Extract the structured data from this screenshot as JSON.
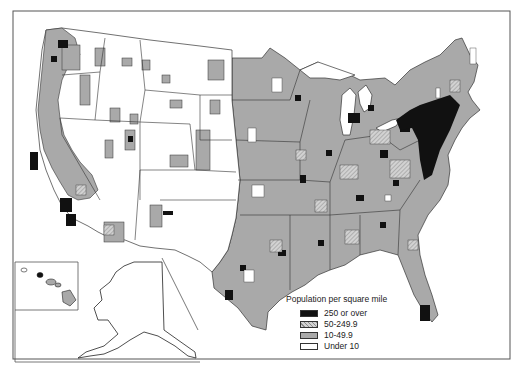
{
  "map": {
    "subject": "United States population density by county",
    "insets": [
      "Alaska",
      "Hawaii"
    ],
    "colors": {
      "border": "#333333",
      "land": "#ffffff",
      "frame": "#555555"
    }
  },
  "legend": {
    "title": "Population per square mile",
    "items": [
      {
        "label": "250 or over",
        "color": "#111111",
        "pattern": "solid"
      },
      {
        "label": "50-249.9",
        "color": "#c8c8c8",
        "pattern": "hatched"
      },
      {
        "label": "10-49.9",
        "color": "#a9a9a9",
        "pattern": "solid"
      },
      {
        "label": "Under 10",
        "color": "#ffffff",
        "pattern": "solid"
      }
    ]
  }
}
